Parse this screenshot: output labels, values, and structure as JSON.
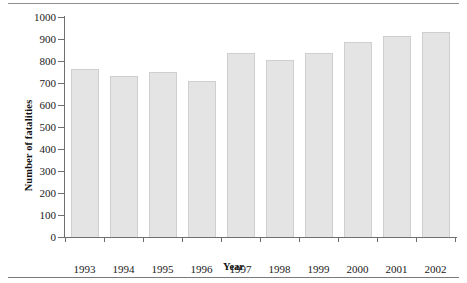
{
  "chart_data": {
    "type": "bar",
    "title": "",
    "xlabel": "Year",
    "ylabel": "Number of fatalities",
    "categories": [
      "1993",
      "1994",
      "1995",
      "1996",
      "1997",
      "1998",
      "1999",
      "2000",
      "2001",
      "2002"
    ],
    "values": [
      765,
      730,
      750,
      710,
      835,
      805,
      835,
      885,
      915,
      930
    ],
    "ylim": [
      0,
      1000
    ],
    "ytick_labels": [
      "1000",
      "900",
      "800",
      "700",
      "600",
      "500",
      "400",
      "300",
      "200",
      "100",
      "0"
    ],
    "ytick_values": [
      1000,
      900,
      800,
      700,
      600,
      500,
      400,
      300,
      200,
      100,
      0
    ],
    "grid": false,
    "legend": null,
    "series": [
      {
        "name": "Number of fatalities",
        "values": [
          765,
          730,
          750,
          710,
          835,
          805,
          835,
          885,
          915,
          930
        ]
      }
    ]
  },
  "style": {
    "bar_fill": "#e4e4e4",
    "bar_border": "#cfcfcf",
    "axis_color": "#6f6f6f",
    "text_color": "#1a1a1a",
    "rule_color": "#8e8e8e",
    "background": "#ffffff"
  }
}
